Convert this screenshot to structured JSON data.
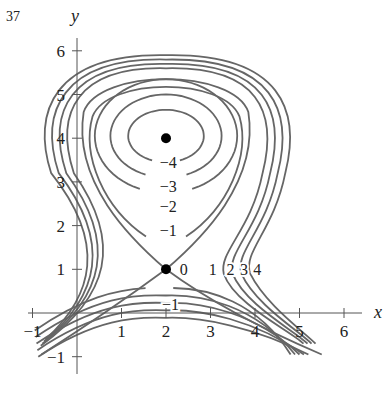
{
  "figure_number": "37",
  "chart_data": {
    "type": "contour",
    "title": "",
    "xlabel": "x",
    "ylabel": "y",
    "xlim": [
      -1,
      6.5
    ],
    "ylim": [
      -1,
      6.3
    ],
    "x_ticks": [
      "-1",
      "1",
      "2",
      "3",
      "4",
      "5",
      "6"
    ],
    "y_ticks": [
      "-1",
      "1",
      "2",
      "3",
      "4",
      "5",
      "6"
    ],
    "grid": false,
    "critical_points": [
      {
        "x": 2,
        "y": 4,
        "type": "local minimum"
      },
      {
        "x": 2,
        "y": 1,
        "type": "saddle",
        "level": 0
      }
    ],
    "level_labels": [
      {
        "text": "-4",
        "x": 2.05,
        "y": 3.45
      },
      {
        "text": "-3",
        "x": 2.05,
        "y": 2.9
      },
      {
        "text": "-2",
        "x": 2.05,
        "y": 2.45
      },
      {
        "text": "-1",
        "x": 2.05,
        "y": 1.9
      },
      {
        "text": "0",
        "x": 2.4,
        "y": 1.0
      },
      {
        "text": "1",
        "x": 3.05,
        "y": 1.0
      },
      {
        "text": "2",
        "x": 3.45,
        "y": 1.0
      },
      {
        "text": "3",
        "x": 3.75,
        "y": 1.0
      },
      {
        "text": "4",
        "x": 4.05,
        "y": 1.0
      },
      {
        "text": "-1",
        "x": 2.1,
        "y": 0.2
      }
    ],
    "levels": [
      -4,
      -3,
      -2,
      -1,
      0,
      1,
      2,
      3,
      4
    ]
  },
  "colors": {
    "contour": "#666666",
    "axis": "#555555",
    "text": "#222222",
    "point": "#000000"
  }
}
